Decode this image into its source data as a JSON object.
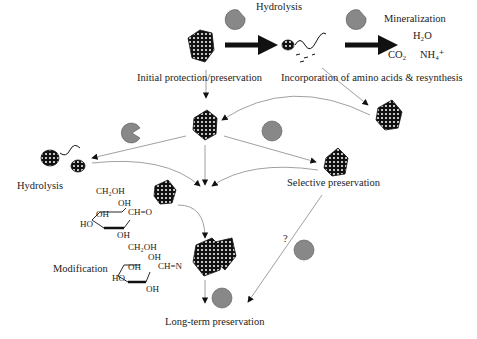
{
  "labels": {
    "hydrolysis_top": "Hydrolysis",
    "mineralization": "Mineralization",
    "h2o": "H₂O",
    "co2": "CO₂",
    "nh4": "NH₄⁺",
    "initial_protection": "Initial protection/preservation",
    "incorporation": "Incorporation of amino acids & resynthesis",
    "hydrolysis_left": "Hydrolysis",
    "selective_preservation": "Selective preservation",
    "modification": "Modification",
    "question": "?",
    "long_term": "Long-term preservation"
  },
  "sugar1": {
    "ch2oh": "CH₂OH",
    "oh1": "OH",
    "oh2": "OH",
    "cho": "CH=O",
    "ho": "HO",
    "oh3": "OH"
  },
  "sugar2": {
    "ch2oh": "CH₂OH",
    "oh1": "OH",
    "oh2": "OH",
    "chn": "CH=N",
    "ho": "HO",
    "oh3": "OH"
  },
  "colors": {
    "arrow": "#888888",
    "bold_arrow": "#111111",
    "enzyme": "#888888",
    "protein": "#111111"
  }
}
